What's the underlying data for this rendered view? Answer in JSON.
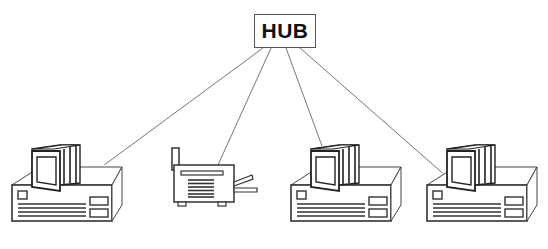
{
  "diagram": {
    "type": "network-star-topology",
    "hub": {
      "label": "HUB"
    },
    "nodes": [
      {
        "id": "pc1",
        "kind": "computer"
      },
      {
        "id": "printer",
        "kind": "printer"
      },
      {
        "id": "pc2",
        "kind": "computer"
      },
      {
        "id": "pc3",
        "kind": "computer"
      }
    ],
    "edges": [
      {
        "from": "hub",
        "to": "pc1"
      },
      {
        "from": "hub",
        "to": "printer"
      },
      {
        "from": "hub",
        "to": "pc2"
      },
      {
        "from": "hub",
        "to": "pc3"
      }
    ],
    "colors": {
      "line": "#555555",
      "stroke": "#333333",
      "fill": "#ffffff"
    }
  }
}
